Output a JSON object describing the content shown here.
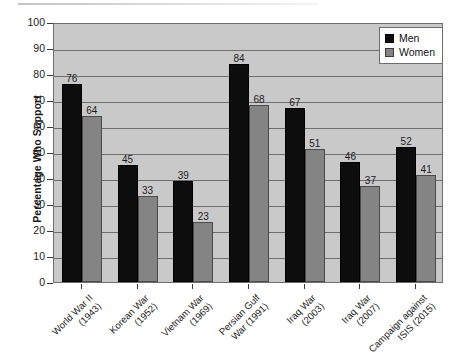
{
  "chart_data": {
    "type": "bar",
    "title": "",
    "xlabel": "",
    "ylabel": "Percentage Who Support",
    "ylim": [
      0,
      100
    ],
    "ytick_step": 10,
    "yticks": [
      100,
      90,
      80,
      70,
      60,
      50,
      40,
      30,
      20,
      10,
      0
    ],
    "grid": true,
    "legend_position": "top-right",
    "categories": [
      "World War II (1943)",
      "Korean War (1952)",
      "Vietnam War (1969)",
      "Persian Gulf War (1991)",
      "Iraq War (2003)",
      "Iraq War (2007)",
      "Campaign against ISIS (2015)"
    ],
    "category_lines": [
      [
        "World War II",
        "(1943)"
      ],
      [
        "Korean War",
        "(1952)"
      ],
      [
        "Vietnam War",
        "(1969)"
      ],
      [
        "Persian Gulf",
        "War (1991)"
      ],
      [
        "Iraq War",
        "(2003)"
      ],
      [
        "Iraq War",
        "(2007)"
      ],
      [
        "Campaign against",
        "ISIS (2015)"
      ]
    ],
    "series": [
      {
        "name": "Men",
        "color": "#0d0d0d",
        "values": [
          76,
          45,
          39,
          84,
          67,
          46,
          52
        ]
      },
      {
        "name": "Women",
        "color": "#848484",
        "values": [
          64,
          33,
          23,
          68,
          51,
          37,
          41
        ]
      }
    ]
  },
  "legend": {
    "items": [
      {
        "label": "Men",
        "swatch": "men-swatch"
      },
      {
        "label": "Women",
        "swatch": "women-swatch"
      }
    ]
  },
  "artifacts": {
    "bottom_cut_text": ""
  }
}
